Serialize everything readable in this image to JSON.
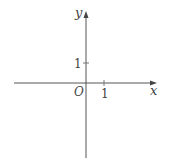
{
  "diagram": {
    "type": "coordinate-plane",
    "x_axis_label": "x",
    "y_axis_label": "y",
    "origin_label": "O",
    "x_tick_label": "1",
    "y_tick_label": "1",
    "axis_color": "#555555",
    "text_color": "#444444"
  }
}
